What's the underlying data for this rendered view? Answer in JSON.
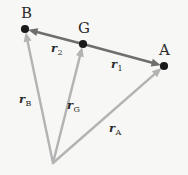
{
  "figure": {
    "background_color": "#f7f7f5",
    "label_color": "#2b2b2b",
    "relative_vector_color": "#6e6e6e",
    "position_vector_color": "#b3b3b3",
    "point_color": "#1a1a1a"
  },
  "points": [
    {
      "id": "B",
      "label": "B",
      "x": 25,
      "y": 29,
      "label_x": 21,
      "label_y": 6
    },
    {
      "id": "G",
      "label": "G",
      "x": 83,
      "y": 44,
      "label_x": 78,
      "label_y": 21
    },
    {
      "id": "A",
      "label": "A",
      "x": 164,
      "y": 66,
      "label_x": 159,
      "label_y": 43
    },
    {
      "id": "O",
      "label": "",
      "x": 53,
      "y": 163,
      "label_x": 0,
      "label_y": 0
    }
  ],
  "vectors": [
    {
      "id": "r2",
      "symbol": "r",
      "subscript": "2",
      "from": "G",
      "to": "B",
      "color": "#6e6e6e",
      "width": 2.6,
      "label_x": 51,
      "label_y": 43
    },
    {
      "id": "r1",
      "symbol": "r",
      "subscript": "1",
      "from": "G",
      "to": "A",
      "color": "#6e6e6e",
      "width": 2.6,
      "label_x": 111,
      "label_y": 59
    },
    {
      "id": "rB",
      "symbol": "r",
      "subscript": "B",
      "from": "O",
      "to": "B",
      "color": "#b3b3b3",
      "width": 2.4,
      "label_x": 19,
      "label_y": 94
    },
    {
      "id": "rG",
      "symbol": "r",
      "subscript": "G",
      "from": "O",
      "to": "G",
      "color": "#b3b3b3",
      "width": 2.4,
      "label_x": 67,
      "label_y": 100
    },
    {
      "id": "rA",
      "symbol": "r",
      "subscript": "A",
      "from": "O",
      "to": "A",
      "color": "#b3b3b3",
      "width": 2.4,
      "label_x": 109,
      "label_y": 123
    }
  ]
}
